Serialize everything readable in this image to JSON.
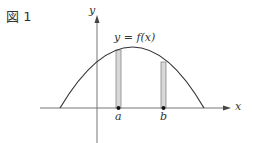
{
  "figure": {
    "label": "図 1"
  },
  "diagram": {
    "x_axis_label": "x",
    "y_axis_label": "y",
    "curve_label": "y = f(x)",
    "points": [
      {
        "label": "a"
      },
      {
        "label": "b"
      }
    ],
    "colors": {
      "axis": "#777777",
      "curve": "#333333",
      "strip_fill": "#d8d8d8",
      "strip_stroke": "#888888",
      "point": "#111111",
      "text": "#333333"
    }
  }
}
